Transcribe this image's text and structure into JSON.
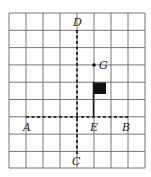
{
  "diagram": {
    "grid": {
      "columns": 8,
      "rows": 9,
      "left": 9,
      "top": 13,
      "cell_w": 17,
      "cell_h": 17.3,
      "color": "#555555"
    },
    "points": {
      "A": {
        "label": "A"
      },
      "B": {
        "label": "B"
      },
      "C": {
        "label": "C"
      },
      "D": {
        "label": "D"
      },
      "E": {
        "label": "E"
      },
      "G": {
        "label": "G"
      }
    },
    "lines": [
      {
        "name": "line-AB",
        "style": "dashed"
      },
      {
        "name": "line-CD",
        "style": "dashed"
      }
    ],
    "flag": {
      "color": "#111111"
    }
  }
}
